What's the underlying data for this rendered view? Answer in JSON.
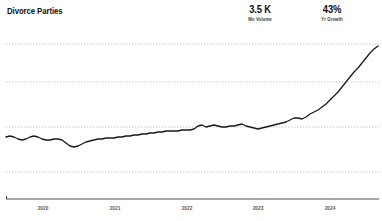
{
  "header": {
    "title": "Divorce Parties"
  },
  "metrics": [
    {
      "name": "mo-volume",
      "value": "3.5 K",
      "label": "Mo Volume"
    },
    {
      "name": "yr-growth",
      "value": "43%",
      "label": "Yr Growth"
    }
  ],
  "colors": {
    "line": "#1a1a1a",
    "gridline": "#b8b8b8",
    "axis": "#3c3c3c",
    "text": "#111111",
    "label": "#555555",
    "background": "#ffffff"
  },
  "chart_data": {
    "type": "line",
    "title": "Divorce Parties",
    "xlabel": "",
    "ylabel": "",
    "grid": true,
    "legend": false,
    "x_tick_labels": [
      "2020",
      "2021",
      "2022",
      "2023",
      "2024"
    ],
    "x_tick_positions": [
      43,
      115,
      187,
      258,
      330
    ],
    "gridline_y_positions": [
      44,
      82,
      127,
      172
    ],
    "axis_y_position": 199,
    "series": [
      {
        "name": "Divorce Parties",
        "color": "#1a1a1a",
        "x": [
          6,
          10,
          14,
          18,
          22,
          26,
          30,
          34,
          38,
          42,
          46,
          50,
          54,
          58,
          62,
          66,
          70,
          74,
          78,
          82,
          86,
          90,
          94,
          98,
          102,
          106,
          110,
          114,
          118,
          122,
          126,
          130,
          134,
          138,
          142,
          146,
          150,
          154,
          158,
          162,
          166,
          170,
          174,
          178,
          182,
          186,
          190,
          194,
          198,
          202,
          206,
          210,
          214,
          218,
          222,
          226,
          230,
          234,
          238,
          242,
          246,
          250,
          254,
          258,
          262,
          266,
          270,
          274,
          278,
          282,
          286,
          290,
          294,
          298,
          302,
          306,
          310,
          314,
          318,
          322,
          326,
          330,
          334,
          338,
          342,
          346,
          350,
          354,
          358,
          362,
          366,
          370,
          374,
          378
        ],
        "y": [
          137,
          136,
          137,
          139,
          140,
          139,
          137,
          136,
          137,
          139,
          140,
          140,
          139,
          139,
          140,
          143,
          146,
          147,
          146,
          144,
          142,
          141,
          140,
          139,
          139,
          138,
          138,
          138,
          137,
          137,
          136,
          136,
          135,
          135,
          134,
          134,
          133,
          133,
          132,
          132,
          131,
          131,
          131,
          131,
          130,
          130,
          130,
          129,
          126,
          125,
          127,
          126,
          125,
          126,
          127,
          127,
          126,
          126,
          125,
          124,
          126,
          127,
          128,
          129,
          128,
          127,
          126,
          125,
          124,
          123,
          122,
          120,
          118,
          118,
          119,
          117,
          114,
          112,
          110,
          107,
          104,
          100,
          96,
          92,
          87,
          82,
          77,
          72,
          68,
          63,
          58,
          53,
          49,
          46
        ]
      }
    ]
  }
}
